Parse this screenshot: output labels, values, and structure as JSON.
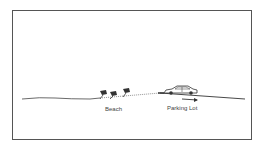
{
  "diagram": {
    "labels": {
      "beach": "Beach",
      "parking_lot": "Parking Lot"
    },
    "elements": {
      "figures_count": 3,
      "vehicle": "car-icon",
      "direction": "arrow-right-icon"
    },
    "colors": {
      "line": "#333333",
      "frame": "#555555",
      "background": "#ffffff"
    }
  }
}
